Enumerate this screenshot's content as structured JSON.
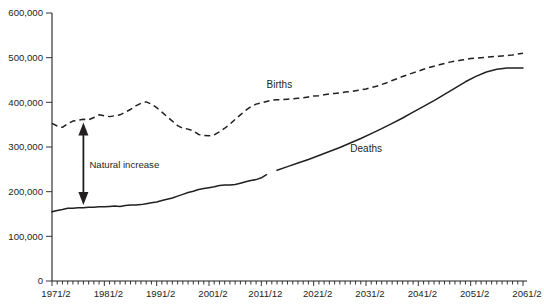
{
  "chart_data": {
    "type": "line",
    "title": "",
    "subtitle": "",
    "xlabel": "",
    "ylabel": "",
    "grid": false,
    "legend_position": "inline-labels",
    "ylim": [
      0,
      600000
    ],
    "y_ticks": [
      "0",
      "100,000",
      "200,000",
      "300,000",
      "400,000",
      "500,000",
      "600,000"
    ],
    "y_tick_values": [
      0,
      100000,
      200000,
      300000,
      400000,
      500000,
      600000
    ],
    "xlim": [
      1971,
      2061
    ],
    "x_ticks": [
      "1971/2",
      "1981/2",
      "1991/2",
      "2001/2",
      "2011/12",
      "2021/2",
      "2031/2",
      "2041/2",
      "2051/2",
      "2061/2"
    ],
    "x_tick_values": [
      1971,
      1981,
      1991,
      2001,
      2011,
      2021,
      2031,
      2041,
      2051,
      2061
    ],
    "annotations": [
      {
        "name": "natural-increase",
        "text": "Natural increase",
        "x": 1977,
        "y_top": 355000,
        "y_bottom": 170000
      }
    ],
    "series": [
      {
        "name": "Births",
        "label": "Births",
        "style": "dashed",
        "color": "#231f20",
        "label_x": 2012,
        "label_y": 432000,
        "x": [
          1971,
          1972,
          1973,
          1974,
          1975,
          1976,
          1977,
          1978,
          1979,
          1980,
          1981,
          1982,
          1983,
          1984,
          1985,
          1986,
          1987,
          1988,
          1989,
          1990,
          1991,
          1992,
          1993,
          1994,
          1995,
          1996,
          1997,
          1998,
          1999,
          2000,
          2001,
          2002,
          2003,
          2004,
          2005,
          2006,
          2007,
          2008,
          2009,
          2010,
          2011,
          2012,
          2013,
          2014,
          2015,
          2016,
          2017,
          2018,
          2019,
          2020,
          2021,
          2022,
          2023,
          2024,
          2025,
          2026,
          2027,
          2028,
          2029,
          2030,
          2031,
          2032,
          2033,
          2034,
          2035,
          2036,
          2037,
          2038,
          2039,
          2040,
          2041,
          2042,
          2043,
          2044,
          2045,
          2046,
          2047,
          2048,
          2049,
          2050,
          2051,
          2052,
          2053,
          2054,
          2055,
          2056,
          2057,
          2058,
          2059,
          2060,
          2061
        ],
        "y": [
          353000,
          347000,
          344000,
          352000,
          358000,
          360000,
          362000,
          361000,
          366000,
          372000,
          370000,
          368000,
          370000,
          372000,
          378000,
          384000,
          392000,
          398000,
          401000,
          396000,
          388000,
          378000,
          368000,
          358000,
          348000,
          342000,
          340000,
          336000,
          328000,
          326000,
          325000,
          327000,
          334000,
          342000,
          351000,
          362000,
          372000,
          382000,
          390000,
          396000,
          399000,
          402000,
          405000,
          406000,
          406000,
          407000,
          408000,
          409000,
          410000,
          412000,
          414000,
          415000,
          417000,
          419000,
          420000,
          421000,
          423000,
          424000,
          426000,
          428000,
          430000,
          433000,
          436000,
          440000,
          444000,
          449000,
          453000,
          458000,
          462000,
          466000,
          470000,
          474000,
          478000,
          481000,
          484000,
          487000,
          490000,
          492000,
          494000,
          496000,
          498000,
          499000,
          500000,
          501000,
          502000,
          503000,
          504000,
          505000,
          506000,
          508000,
          510000
        ]
      },
      {
        "name": "Deaths (historical)",
        "label": "Deaths",
        "style": "solid",
        "color": "#231f20",
        "label_x": 2028,
        "label_y": 290000,
        "x": [
          1971,
          1972,
          1973,
          1974,
          1975,
          1976,
          1977,
          1978,
          1979,
          1980,
          1981,
          1982,
          1983,
          1984,
          1985,
          1986,
          1987,
          1988,
          1989,
          1990,
          1991,
          1992,
          1993,
          1994,
          1995,
          1996,
          1997,
          1998,
          1999,
          2000,
          2001,
          2002,
          2003,
          2004,
          2005,
          2006,
          2007,
          2008,
          2009,
          2010,
          2011,
          2012
        ],
        "y": [
          155000,
          158000,
          160000,
          163000,
          163000,
          164000,
          164000,
          165000,
          165000,
          166000,
          166000,
          167000,
          168000,
          167000,
          169000,
          170000,
          170000,
          171000,
          173000,
          175000,
          177000,
          180000,
          183000,
          186000,
          190000,
          194000,
          198000,
          201000,
          205000,
          207000,
          209000,
          211000,
          214000,
          215000,
          215000,
          216000,
          219000,
          222000,
          225000,
          227000,
          231000,
          238000
        ]
      },
      {
        "name": "Deaths (projected)",
        "label": "",
        "style": "solid",
        "color": "#231f20",
        "x": [
          2014,
          2016,
          2018,
          2020,
          2022,
          2024,
          2026,
          2028,
          2030,
          2032,
          2034,
          2036,
          2038,
          2040,
          2042,
          2044,
          2046,
          2048,
          2050,
          2052,
          2054,
          2056,
          2058,
          2060,
          2061
        ],
        "y": [
          248000,
          256000,
          264000,
          272000,
          281000,
          290000,
          299000,
          309000,
          319000,
          330000,
          341000,
          353000,
          365000,
          378000,
          391000,
          404000,
          418000,
          432000,
          446000,
          458000,
          468000,
          474000,
          477000,
          477000,
          477000
        ]
      }
    ]
  }
}
